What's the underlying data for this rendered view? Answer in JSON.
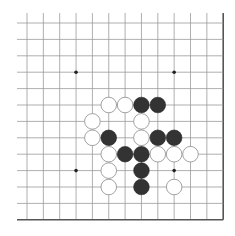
{
  "board": {
    "title": "Go board diagram (lower-right corner region)",
    "grid": {
      "cols": 13,
      "rows": 13,
      "origin_x": 27,
      "origin_y": 23,
      "spacing_x": 16.35,
      "spacing_y": 16.4,
      "extend_left": 10,
      "extend_top": 10,
      "line_color": "#9a9a9a",
      "edge_color": "#555555"
    },
    "star_points": [
      {
        "col": 3,
        "row": 3
      },
      {
        "col": 9,
        "row": 3
      },
      {
        "col": 3,
        "row": 9
      },
      {
        "col": 9,
        "row": 9
      }
    ],
    "stones": [
      {
        "color": "white",
        "col": 5,
        "row": 5
      },
      {
        "color": "white",
        "col": 6,
        "row": 5
      },
      {
        "color": "black",
        "col": 7,
        "row": 5
      },
      {
        "color": "black",
        "col": 8,
        "row": 5
      },
      {
        "color": "white",
        "col": 4,
        "row": 6
      },
      {
        "color": "white",
        "col": 7,
        "row": 6
      },
      {
        "color": "white",
        "col": 4,
        "row": 7
      },
      {
        "color": "black",
        "col": 5,
        "row": 7
      },
      {
        "color": "white",
        "col": 7,
        "row": 7
      },
      {
        "color": "black",
        "col": 8,
        "row": 7
      },
      {
        "color": "black",
        "col": 9,
        "row": 7
      },
      {
        "color": "white",
        "col": 5,
        "row": 8
      },
      {
        "color": "black",
        "col": 6,
        "row": 8
      },
      {
        "color": "black",
        "col": 7,
        "row": 8
      },
      {
        "color": "white",
        "col": 8,
        "row": 8
      },
      {
        "color": "white",
        "col": 9,
        "row": 8
      },
      {
        "color": "white",
        "col": 10,
        "row": 8
      },
      {
        "color": "white",
        "col": 5,
        "row": 9
      },
      {
        "color": "black",
        "col": 7,
        "row": 9
      },
      {
        "color": "white",
        "col": 5,
        "row": 10
      },
      {
        "color": "black",
        "col": 7,
        "row": 10
      },
      {
        "color": "white",
        "col": 9,
        "row": 10
      }
    ],
    "colors": {
      "black_stone": "#333333",
      "white_stone": "#ffffff",
      "white_stone_outline": "#8a8a8a",
      "star_point": "#222222"
    }
  }
}
